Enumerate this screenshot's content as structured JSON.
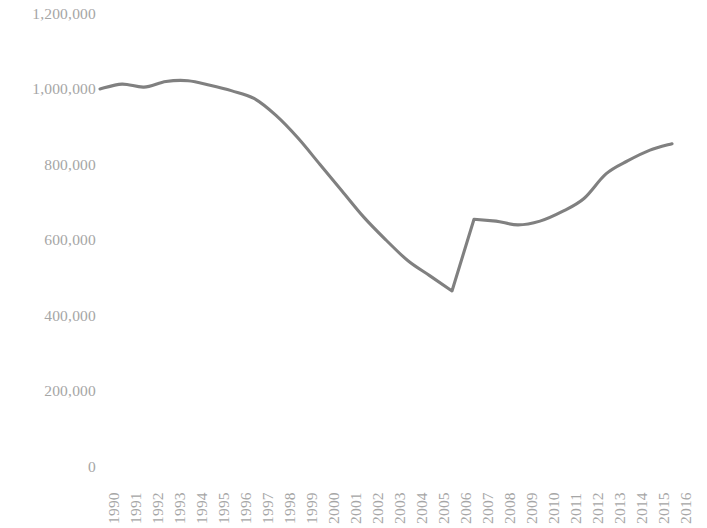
{
  "chart_data": {
    "type": "line",
    "title": "",
    "subtitle": "",
    "xlabel": "",
    "ylabel": "",
    "grid": false,
    "legend": false,
    "legend_position": "none",
    "line_color": "#808080",
    "categories": [
      "1990",
      "1991",
      "1992",
      "1993",
      "1994",
      "1995",
      "1996",
      "1997",
      "1998",
      "1999",
      "2000",
      "2001",
      "2002",
      "2003",
      "2004",
      "2005",
      "2006",
      "2007",
      "2008",
      "2009",
      "2010",
      "2011",
      "2012",
      "2013",
      "2014",
      "2015",
      "2016"
    ],
    "values": [
      1000000,
      1013000,
      1005000,
      1020000,
      1022000,
      1010000,
      995000,
      975000,
      930000,
      870000,
      800000,
      730000,
      660000,
      600000,
      545000,
      505000,
      465000,
      655000,
      650000,
      640000,
      650000,
      675000,
      710000,
      775000,
      810000,
      838000,
      855000
    ],
    "ylim": [
      0,
      1200000
    ],
    "yticks": [
      0,
      200000,
      400000,
      600000,
      800000,
      1000000,
      1200000
    ],
    "ytick_labels": [
      "0",
      "200,000",
      "400,000",
      "600,000",
      "800,000",
      "1,000,000",
      "1,200,000"
    ],
    "xtick_labels": [
      "1990",
      "1991",
      "1992",
      "1993",
      "1994",
      "1995",
      "1996",
      "1997",
      "1998",
      "1999",
      "2000",
      "2001",
      "2002",
      "2003",
      "2004",
      "2005",
      "2006",
      "2007",
      "2008",
      "2009",
      "2010",
      "2011",
      "2012",
      "2013",
      "2014",
      "2015",
      "2016"
    ],
    "annotations": []
  },
  "axis_label_color": "#a6a6a6"
}
